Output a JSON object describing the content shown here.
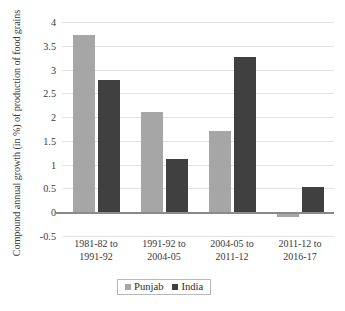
{
  "chart_data": {
    "type": "bar",
    "title": "",
    "xlabel": "",
    "ylabel": "Compound annual growth (in %) of production of food grains",
    "categories": [
      "1981-82 to 1991-92",
      "1991-92 to 2004-05",
      "2004-05 to 2011-12",
      "2011-12 to 2016-17"
    ],
    "category_lines": [
      [
        "1981-82 to",
        "1991-92"
      ],
      [
        "1991-92 to",
        "2004-05"
      ],
      [
        "2004-05 to",
        "2011-12"
      ],
      [
        "2011-12 to",
        "2016-17"
      ]
    ],
    "series": [
      {
        "name": "Punjab",
        "color": "#A6A6A6",
        "values": [
          3.73,
          2.1,
          1.7,
          -0.1
        ]
      },
      {
        "name": "India",
        "color": "#404040",
        "values": [
          2.77,
          1.11,
          3.27,
          0.52
        ]
      }
    ],
    "ylim": [
      -0.5,
      4
    ],
    "ytick_labels": [
      "4",
      "3.5",
      "3",
      "2.5",
      "2",
      "1.5",
      "1",
      "0.5",
      "0",
      "-0.5"
    ],
    "ytick_values": [
      4,
      3.5,
      3,
      2.5,
      2,
      1.5,
      1,
      0.5,
      0,
      -0.5
    ],
    "grid": true,
    "legend_position": "bottom"
  },
  "legend": {
    "items": [
      {
        "label": "Punjab",
        "color": "#A6A6A6"
      },
      {
        "label": "India",
        "color": "#404040"
      }
    ]
  },
  "caption": {
    "text": ""
  }
}
